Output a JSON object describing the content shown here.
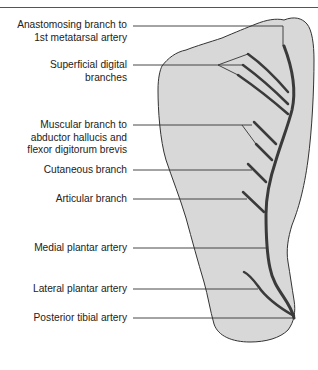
{
  "diagram": {
    "type": "anatomical-labeled-diagram",
    "colors": {
      "foot_fill": "#d8d8d8",
      "outline": "#333333",
      "artery": "#3a3a3a",
      "leader": "#333333",
      "text": "#222222"
    },
    "labels": [
      {
        "id": "anastomosing",
        "lines": [
          "Anastomosing branch to",
          "1st metatarsal artery"
        ]
      },
      {
        "id": "superficial-digital",
        "lines": [
          "Superficial digital",
          "branches"
        ]
      },
      {
        "id": "muscular",
        "lines": [
          "Muscular branch to",
          "abductor hallucis and",
          "flexor digitorum brevis"
        ]
      },
      {
        "id": "cutaneous",
        "lines": [
          "Cutaneous branch"
        ]
      },
      {
        "id": "articular",
        "lines": [
          "Articular branch"
        ]
      },
      {
        "id": "medial-plantar",
        "lines": [
          "Medial plantar artery"
        ]
      },
      {
        "id": "lateral-plantar",
        "lines": [
          "Lateral plantar artery"
        ]
      },
      {
        "id": "posterior-tibial",
        "lines": [
          "Posterior tibial artery"
        ]
      }
    ]
  }
}
